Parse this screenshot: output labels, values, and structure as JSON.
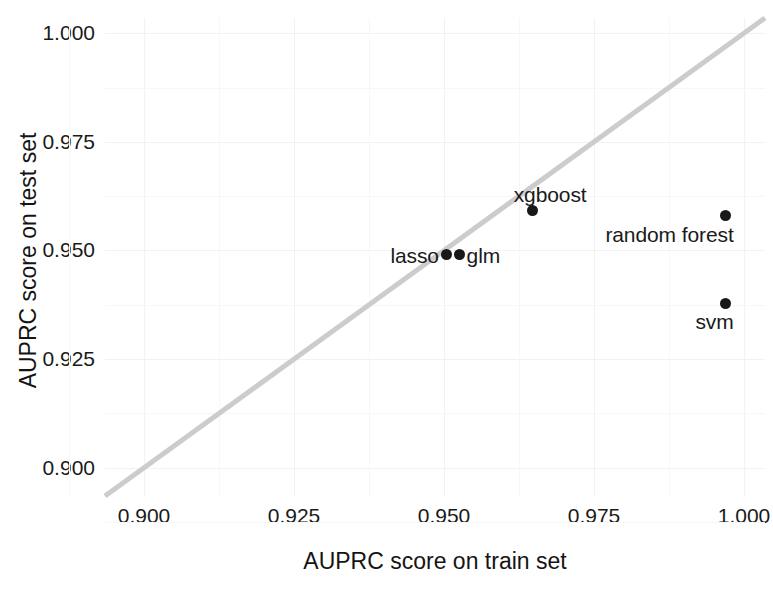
{
  "chart_data": {
    "type": "scatter",
    "title": "",
    "xlabel": "AUPRC score on train set",
    "ylabel": "AUPRC score on test set",
    "xlim": [
      0.8935,
      1.0035
    ],
    "ylim": [
      0.8935,
      1.0035
    ],
    "xticks": [
      "0.900",
      "0.925",
      "0.950",
      "0.975",
      "1.000"
    ],
    "xtick_values": [
      0.9,
      0.925,
      0.95,
      0.975,
      1.0
    ],
    "yticks": [
      "0.900",
      "0.925",
      "0.950",
      "0.975",
      "1.000"
    ],
    "ytick_values": [
      0.9,
      0.925,
      0.95,
      0.975,
      1.0
    ],
    "grid": true,
    "legend": "none",
    "points": [
      {
        "label": "lasso",
        "x": 0.9504,
        "y": 0.949,
        "label_side": "left"
      },
      {
        "label": "glm",
        "x": 0.9526,
        "y": 0.949,
        "label_side": "right"
      },
      {
        "label": "xgboost",
        "x": 0.9647,
        "y": 0.9592,
        "label_side": "above"
      },
      {
        "label": "random forest",
        "x": 0.9969,
        "y": 0.958,
        "label_side": "below-left"
      },
      {
        "label": "svm",
        "x": 0.9969,
        "y": 0.9378,
        "label_side": "below-left"
      }
    ],
    "reference_line": {
      "name": "identity-line",
      "description": "y = x diagonal",
      "slope": 1,
      "intercept": 0,
      "color": "#cccccc"
    },
    "point_color": "#181818",
    "grid_color": "#f2f2f2",
    "background_color": "#ffffff"
  }
}
